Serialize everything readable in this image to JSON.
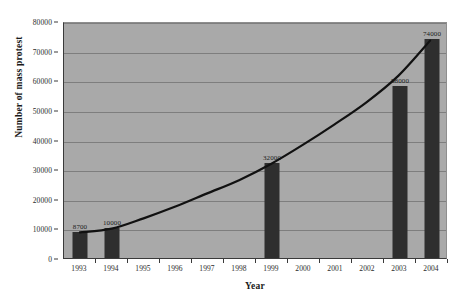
{
  "chart_data": {
    "type": "bar",
    "title": "",
    "xlabel": "Year",
    "ylabel": "Number of mass protest",
    "categories": [
      "1993",
      "1994",
      "1995",
      "1996",
      "1997",
      "1998",
      "1999",
      "2000",
      "2001",
      "2002",
      "2003",
      "2004"
    ],
    "values": [
      8700,
      10000,
      null,
      null,
      null,
      null,
      32000,
      null,
      null,
      null,
      58000,
      74000
    ],
    "bars": [
      {
        "category": "1993",
        "value": 8700,
        "label": "8700"
      },
      {
        "category": "1994",
        "value": 10000,
        "label": "10000"
      },
      {
        "category": "1999",
        "value": 32000,
        "label": "32000"
      },
      {
        "category": "2003",
        "value": 58000,
        "label": "58000"
      },
      {
        "category": "2004",
        "value": 74000,
        "label": "74000"
      }
    ],
    "trend_series": {
      "name": "trend",
      "x": [
        "1993",
        "1994",
        "1995",
        "1996",
        "1997",
        "1998",
        "1999",
        "2000",
        "2001",
        "2002",
        "2003",
        "2004"
      ],
      "values": [
        8700,
        10000,
        13500,
        17500,
        22000,
        26500,
        32000,
        38500,
        45500,
        53000,
        62000,
        74000
      ]
    },
    "ylim": [
      0,
      80000
    ],
    "yticks": [
      0,
      10000,
      20000,
      30000,
      40000,
      50000,
      60000,
      70000,
      80000
    ],
    "ytick_labels": [
      "0",
      "10000",
      "20000",
      "30000",
      "40000",
      "50000",
      "60000",
      "70000",
      "80000"
    ],
    "grid": true,
    "legend": "none",
    "colors": {
      "plot_background": "#a9a9a9",
      "bar": "#2e2e2e",
      "gridline": "#7e7e7e",
      "axis": "#3a3a3a",
      "curve": "#111111",
      "page_background": "#ffffff",
      "text": "#2b2b2b"
    }
  }
}
